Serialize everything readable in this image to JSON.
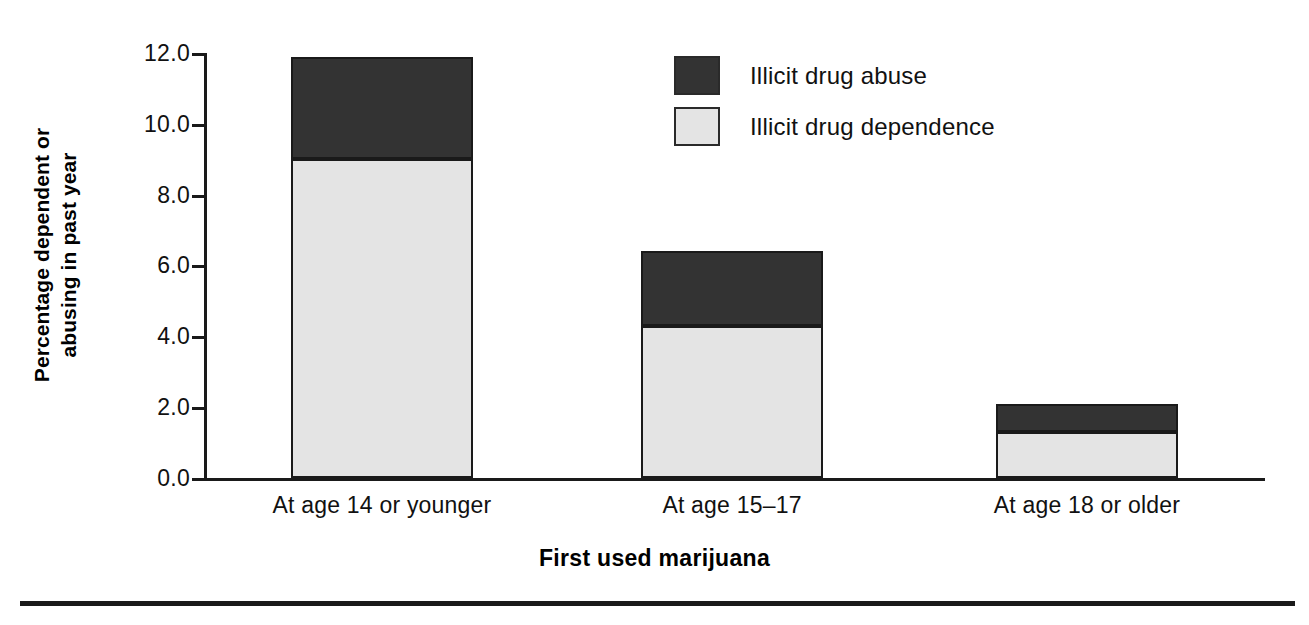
{
  "chart_data": {
    "type": "bar",
    "stacked": true,
    "title": "",
    "subtitle": "",
    "xlabel": "First used marijuana",
    "ylabel": "Percentage dependent or abusing in past year",
    "ylabel_lines": [
      "Percentage dependent or",
      "abusing in past year"
    ],
    "categories": [
      "At age 14 or younger",
      "At age 15–17",
      "At age 18 or older"
    ],
    "series": [
      {
        "name": "Illicit drug dependence",
        "values": [
          9.0,
          4.3,
          1.3
        ],
        "color": "#e4e4e4"
      },
      {
        "name": "Illicit drug abuse",
        "values": [
          2.9,
          2.1,
          0.8
        ],
        "color": "#333333"
      }
    ],
    "totals": [
      11.9,
      6.4,
      2.1
    ],
    "ylim": [
      0.0,
      12.0
    ],
    "ytick_values": [
      12.0,
      10.0,
      8.0,
      6.0,
      4.0,
      2.0,
      0.0
    ],
    "ytick_labels": [
      "12.0",
      "10.0",
      "8.0",
      "6.0",
      "4.0",
      "2.0",
      "0.0"
    ],
    "grid": false,
    "legend_position": "upper-center-right",
    "legend_order": [
      "Illicit drug abuse",
      "Illicit drug dependence"
    ]
  },
  "legend": {
    "items": [
      {
        "label": "Illicit drug abuse",
        "swatch": "dark-swatch-icon"
      },
      {
        "label": "Illicit drug dependence",
        "swatch": "light-swatch-icon"
      }
    ]
  },
  "axes": {
    "x_title": "First used marijuana",
    "y_title_line1": "Percentage dependent or",
    "y_title_line2": "abusing in past year"
  },
  "colors": {
    "abuse": "#333333",
    "dependence": "#e4e4e4",
    "axis": "#1a1a1a",
    "text": "#111111",
    "background": "#ffffff"
  }
}
